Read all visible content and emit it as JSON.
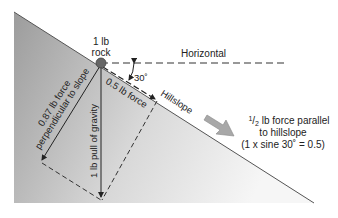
{
  "diagram": {
    "rock_label_line1": "1 lb",
    "rock_label_line2": "rock",
    "horizontal_label": "Horizontal",
    "angle_label": "30˚",
    "hillslope_label": "Hillslope",
    "parallel_force_label": "0.5 lb force",
    "perpendicular_force_line1": "0.87 lb force",
    "perpendicular_force_line2": "perpendicular to slope",
    "gravity_label": "1 lb pull of gravity",
    "callout": {
      "fraction_num": "1",
      "fraction_den": "2",
      "line1_rest": " lb force parallel",
      "line2": "to hillslope",
      "line3": "(1 x sine 30˚ = 0.5)"
    },
    "colors": {
      "slope_dark": "#9a9a9a",
      "slope_light": "#f4f4f4",
      "line": "#333333",
      "arrow_fill": "#a8a8a8"
    }
  }
}
